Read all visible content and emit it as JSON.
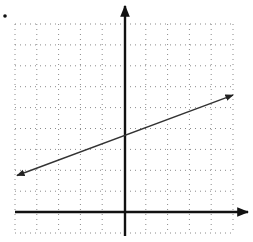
{
  "chart_data": {
    "type": "line",
    "title": "",
    "xlabel": "",
    "ylabel": "",
    "grid": true,
    "grid_style": "dotted",
    "xlim": [
      -5,
      5
    ],
    "ylim": [
      -1,
      9
    ],
    "axes": {
      "x_arrow": true,
      "y_arrow": true
    },
    "series": [
      {
        "name": "line",
        "description": "Straight line with arrows on both ends, positive slope",
        "x": [
          -5,
          5
        ],
        "y": [
          1.75,
          5.6
        ],
        "approx_slope": 0.4,
        "approx_y_intercept": 3.7,
        "arrows_both_ends": true
      }
    ],
    "marker_dot": true
  },
  "colors": {
    "axis": "#111111",
    "grid": "#8a8a8a",
    "line": "#333333",
    "background": "#ffffff"
  }
}
